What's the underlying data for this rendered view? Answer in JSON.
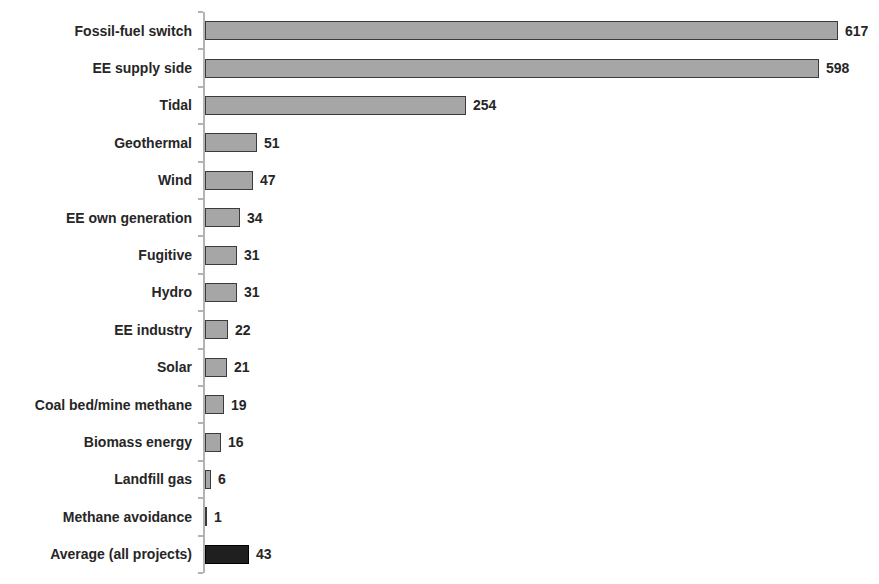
{
  "chart_data": {
    "type": "bar",
    "orientation": "horizontal",
    "title": "",
    "xlabel": "",
    "ylabel": "",
    "xlim": [
      0,
      650
    ],
    "grid": false,
    "legend": "none",
    "value_labels_shown": true,
    "categories": [
      "Fossil-fuel switch",
      "EE supply side",
      "Tidal",
      "Geothermal",
      "Wind",
      "EE own generation",
      "Fugitive",
      "Hydro",
      "EE industry",
      "Solar",
      "Coal bed/mine methane",
      "Biomass energy",
      "Landfill gas",
      "Methane avoidance",
      "Average (all projects)"
    ],
    "values": [
      617,
      598,
      254,
      51,
      47,
      34,
      31,
      31,
      22,
      21,
      19,
      16,
      6,
      1,
      43
    ],
    "highlight_index": 14,
    "highlighted_category": "Average (all projects)"
  },
  "style": {
    "background": "#ffffff",
    "bar_fill": "#a6a6a6",
    "bar_border": "#3b3b3b",
    "highlight_fill": "#1f1f1f",
    "highlight_border": "#000000",
    "axis_color": "#b3b3b3",
    "text_color": "#262626"
  }
}
